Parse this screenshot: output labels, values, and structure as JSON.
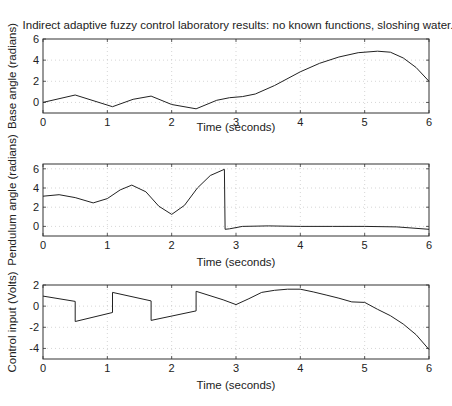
{
  "figure_title": "Indirect adaptive fuzzy control laboratory results:  no known functions, sloshing water.",
  "chart_data": [
    {
      "type": "line",
      "title": "Indirect adaptive fuzzy control laboratory results:  no known functions, sloshing water.",
      "xlabel": "Time (seconds)",
      "ylabel": "Base angle (radians)",
      "xlim": [
        0,
        6
      ],
      "ylim": [
        -1,
        6
      ],
      "xticks": [
        0,
        1,
        2,
        3,
        4,
        5,
        6
      ],
      "yticks": [
        0,
        2,
        4,
        6
      ],
      "grid": true,
      "x": [
        0,
        0.5,
        1.08,
        1.4,
        1.68,
        2.0,
        2.38,
        2.7,
        2.9,
        3.1,
        3.3,
        3.6,
        4.0,
        4.3,
        4.6,
        4.9,
        5.2,
        5.4,
        5.6,
        5.8,
        6.0
      ],
      "y": [
        0,
        0.7,
        -0.4,
        0.3,
        0.6,
        -0.2,
        -0.6,
        0.2,
        0.45,
        0.55,
        0.8,
        1.6,
        2.9,
        3.7,
        4.3,
        4.7,
        4.85,
        4.75,
        4.2,
        3.3,
        2.0
      ]
    },
    {
      "type": "line",
      "xlabel": "Time (seconds)",
      "ylabel": "Pendulum angle (radians)",
      "xlim": [
        0,
        6
      ],
      "ylim": [
        -1,
        6.5
      ],
      "xticks": [
        0,
        1,
        2,
        3,
        4,
        5,
        6
      ],
      "yticks": [
        0,
        2,
        4,
        6
      ],
      "grid": true,
      "x": [
        0,
        0.25,
        0.5,
        0.78,
        1.0,
        1.2,
        1.38,
        1.6,
        1.8,
        2.0,
        2.2,
        2.4,
        2.6,
        2.82,
        2.83,
        2.9,
        3.1,
        3.5,
        4.0,
        4.5,
        5.0,
        5.5,
        6.0
      ],
      "y": [
        3.15,
        3.3,
        3.0,
        2.45,
        2.9,
        3.8,
        4.3,
        3.6,
        2.1,
        1.25,
        2.2,
        4.0,
        5.3,
        5.95,
        -0.3,
        -0.25,
        0.0,
        0.05,
        0.0,
        0.0,
        0.0,
        -0.05,
        -0.3
      ]
    },
    {
      "type": "line",
      "xlabel": "Time (seconds)",
      "ylabel": "Control input (Volts)",
      "xlim": [
        0,
        6
      ],
      "ylim": [
        -5,
        2
      ],
      "xticks": [
        0,
        1,
        2,
        3,
        4,
        5,
        6
      ],
      "yticks": [
        -4,
        -2,
        0,
        2
      ],
      "grid": true,
      "x": [
        0,
        0.5,
        0.5,
        1.08,
        1.08,
        1.68,
        1.68,
        2.38,
        2.38,
        2.8,
        3.0,
        3.2,
        3.4,
        3.6,
        3.8,
        4.0,
        4.2,
        4.4,
        4.6,
        4.8,
        5.0,
        5.2,
        5.4,
        5.6,
        5.8,
        6.0
      ],
      "y": [
        0.95,
        0.45,
        -1.45,
        -0.6,
        1.3,
        0.5,
        -1.35,
        -0.45,
        1.4,
        0.6,
        0.15,
        0.7,
        1.3,
        1.5,
        1.6,
        1.6,
        1.35,
        1.05,
        0.75,
        0.4,
        0.35,
        -0.3,
        -0.9,
        -1.7,
        -2.7,
        -4.1
      ]
    }
  ],
  "tick_labels": {
    "x": [
      "0",
      "1",
      "2",
      "3",
      "4",
      "5",
      "6"
    ],
    "plot1_y": [
      "0",
      "2",
      "4",
      "6"
    ],
    "plot2_y": [
      "0",
      "2",
      "4",
      "6"
    ],
    "plot3_y": [
      "-4",
      "-2",
      "0",
      "2"
    ]
  }
}
